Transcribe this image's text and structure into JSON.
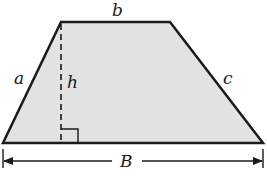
{
  "diagram": {
    "labels": {
      "top_base": "b",
      "left_side": "a",
      "height": "h",
      "right_side": "c",
      "bottom_base": "B"
    },
    "colors": {
      "fill": "#e2e2e2",
      "stroke": "#1a1a1a",
      "background": "#ffffff"
    }
  }
}
